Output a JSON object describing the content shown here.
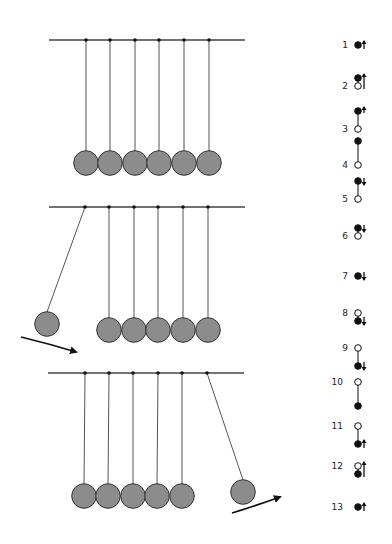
{
  "figure": {
    "colors": {
      "ball": "#8c8c8c",
      "outline": "#333333",
      "string": "#555555",
      "bar": "#444444",
      "arrow": "#111111"
    },
    "panels": [
      {
        "id": "rest",
        "bar": {
          "x1": 49,
          "x2": 245,
          "y": 40
        },
        "pivots_x": [
          86,
          110,
          135,
          159,
          184,
          209
        ],
        "balls": [
          {
            "x": 86,
            "y": 163
          },
          {
            "x": 110,
            "y": 163
          },
          {
            "x": 135,
            "y": 163
          },
          {
            "x": 159,
            "y": 163
          },
          {
            "x": 184,
            "y": 163
          },
          {
            "x": 209,
            "y": 163
          }
        ],
        "arrow": null
      },
      {
        "id": "incoming",
        "bar": {
          "x1": 49,
          "x2": 245,
          "y": 207
        },
        "pivots_x": [
          85,
          109,
          134,
          158,
          183,
          208
        ],
        "balls": [
          {
            "x": 47,
            "y": 324
          },
          {
            "x": 109,
            "y": 330
          },
          {
            "x": 134,
            "y": 330
          },
          {
            "x": 158,
            "y": 330
          },
          {
            "x": 183,
            "y": 330
          },
          {
            "x": 208,
            "y": 330
          }
        ],
        "arrow": {
          "path": "M21,337 Q50,344 76,352",
          "head": "76,352"
        }
      },
      {
        "id": "outgoing",
        "bar": {
          "x1": 48,
          "x2": 244,
          "y": 373
        },
        "pivots_x": [
          85,
          109,
          133,
          158,
          182,
          207
        ],
        "balls": [
          {
            "x": 84,
            "y": 496
          },
          {
            "x": 108,
            "y": 496
          },
          {
            "x": 133,
            "y": 496
          },
          {
            "x": 157,
            "y": 496
          },
          {
            "x": 182,
            "y": 496
          },
          {
            "x": 243,
            "y": 492
          }
        ],
        "arrow": {
          "path": "M232,513 Q258,505 280,497",
          "head": "280,497"
        }
      }
    ],
    "sequence": {
      "x_label": 348,
      "x_icon": 358,
      "steps": [
        {
          "label": "1",
          "y": 45,
          "type": "single",
          "arrow": "up"
        },
        {
          "label": "2",
          "y": 82,
          "type": "stack-close",
          "top": "filled",
          "bottom": "open",
          "arrow": "up-long"
        },
        {
          "label": "3",
          "y": 120,
          "type": "stack-short",
          "top": "filled",
          "bottom": "open",
          "arrow": "up-top"
        },
        {
          "label": "4",
          "y": 153,
          "type": "stack-long",
          "top": "filled",
          "bottom": "open",
          "arrow": "none"
        },
        {
          "label": "5",
          "y": 190,
          "type": "stack-short",
          "top": "filled",
          "bottom": "open",
          "arrow": "down-top"
        },
        {
          "label": "6",
          "y": 232,
          "type": "stack-close",
          "top": "filled",
          "bottom": "open",
          "arrow": "down-top"
        },
        {
          "label": "7",
          "y": 276,
          "type": "single",
          "arrow": "down"
        },
        {
          "label": "8",
          "y": 317,
          "type": "stack-close",
          "top": "open",
          "bottom": "filled",
          "arrow": "down-bottom"
        },
        {
          "label": "9",
          "y": 357,
          "type": "stack-short",
          "top": "open",
          "bottom": "filled",
          "arrow": "down-bottom"
        },
        {
          "label": "10",
          "y": 394,
          "type": "stack-long",
          "top": "open",
          "bottom": "filled",
          "arrow": "none"
        },
        {
          "label": "11",
          "y": 435,
          "type": "stack-short",
          "top": "open",
          "bottom": "filled",
          "arrow": "up-bottom"
        },
        {
          "label": "12",
          "y": 470,
          "type": "stack-close",
          "top": "open",
          "bottom": "filled",
          "arrow": "up-long"
        },
        {
          "label": "13",
          "y": 507,
          "type": "single",
          "arrow": "up"
        }
      ]
    }
  }
}
